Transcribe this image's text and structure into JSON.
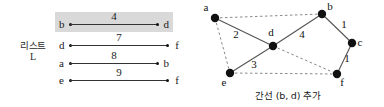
{
  "list_panel": {
    "label_line1": "리스트",
    "label_line2": "L",
    "rows": [
      {
        "from": "b",
        "to": "d",
        "weight": "4",
        "highlighted": true
      },
      {
        "from": "d",
        "to": "f",
        "weight": "7",
        "highlighted": false
      },
      {
        "from": "a",
        "to": "b",
        "weight": "8",
        "highlighted": false
      },
      {
        "from": "e",
        "to": "f",
        "weight": "9",
        "highlighted": false
      }
    ]
  },
  "graph_panel": {
    "caption": "간선 (b, d) 추가",
    "nodes": [
      {
        "id": "a",
        "label": "a",
        "x": 23,
        "y": 18,
        "label_dx": -9,
        "label_dy": -7
      },
      {
        "id": "b",
        "label": "b",
        "x": 130,
        "y": 14,
        "label_dx": 8,
        "label_dy": -4
      },
      {
        "id": "c",
        "label": "c",
        "x": 160,
        "y": 43,
        "label_dx": 8,
        "label_dy": 3
      },
      {
        "id": "d",
        "label": "d",
        "x": 81,
        "y": 46,
        "label_dx": -2,
        "label_dy": -10
      },
      {
        "id": "e",
        "label": "e",
        "x": 38,
        "y": 73,
        "label_dx": -6,
        "label_dy": 13
      },
      {
        "id": "f",
        "label": "f",
        "x": 145,
        "y": 74,
        "label_dx": 5,
        "label_dy": 12
      }
    ],
    "edges": [
      {
        "from": "a",
        "to": "d",
        "weight": "2",
        "style": "solid",
        "wx": 44,
        "wy": 38
      },
      {
        "from": "d",
        "to": "e",
        "weight": "3",
        "style": "solid",
        "wx": 62,
        "wy": 68
      },
      {
        "from": "d",
        "to": "b",
        "weight": "4",
        "style": "solid",
        "wx": 110,
        "wy": 38
      },
      {
        "from": "b",
        "to": "c",
        "weight": "1",
        "style": "solid",
        "wx": 152,
        "wy": 28
      },
      {
        "from": "c",
        "to": "f",
        "weight": "1",
        "style": "solid",
        "wx": 155,
        "wy": 62
      },
      {
        "from": "a",
        "to": "b",
        "weight": "",
        "style": "dashed",
        "wx": 0,
        "wy": 0
      },
      {
        "from": "a",
        "to": "e",
        "weight": "",
        "style": "dashed",
        "wx": 0,
        "wy": 0
      },
      {
        "from": "e",
        "to": "f",
        "weight": "",
        "style": "dashed",
        "wx": 0,
        "wy": 0
      },
      {
        "from": "d",
        "to": "f",
        "weight": "",
        "style": "dashed",
        "wx": 0,
        "wy": 0
      }
    ]
  },
  "colors": {
    "highlight_bg": "#d9d9d9",
    "node_fill": "#111111",
    "edge_solid": "#555555",
    "edge_dashed": "#888888",
    "text": "#111111",
    "background": "#ffffff"
  }
}
